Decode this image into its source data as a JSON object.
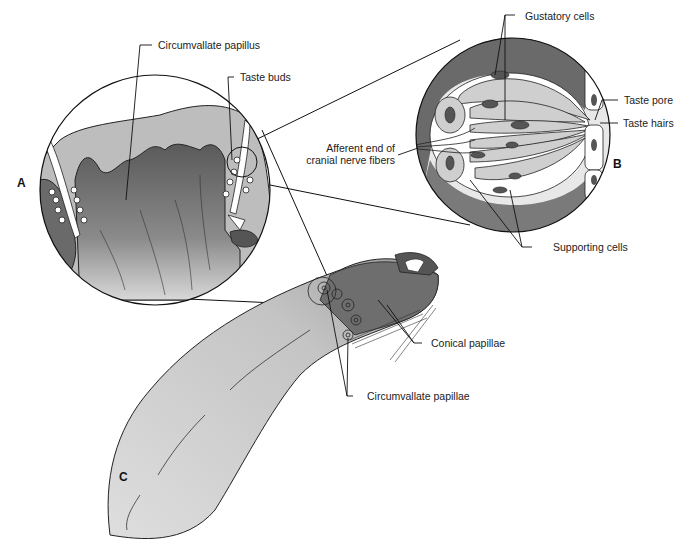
{
  "figure": {
    "panels": {
      "a": "A",
      "b": "B",
      "c": "C"
    },
    "labels": {
      "circumvallate_papillus": "Circumvallate papillus",
      "taste_buds": "Taste buds",
      "gustatory_cells": "Gustatory cells",
      "taste_pore": "Taste pore",
      "taste_hairs": "Taste hairs",
      "afferent_line1": "Afferent end of",
      "afferent_line2": "cranial nerve fibers",
      "supporting_cells": "Supporting cells",
      "conical_papillae": "Conical papillae",
      "circumvallate_papillae": "Circumvallate papillae"
    }
  }
}
